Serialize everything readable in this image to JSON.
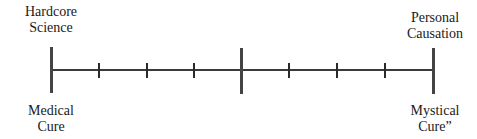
{
  "diagram": {
    "type": "continuum-scale",
    "left_top": [
      "Hardcore",
      "Science"
    ],
    "left_bottom": [
      "Medical",
      "Cure"
    ],
    "right_top": [
      "Personal",
      "Causation"
    ],
    "right_bottom": [
      "Mystical",
      "Cure”"
    ],
    "anchors_x": [
      51,
      241,
      433
    ],
    "ticks_x": [
      99,
      147,
      194,
      289,
      337,
      385
    ]
  }
}
